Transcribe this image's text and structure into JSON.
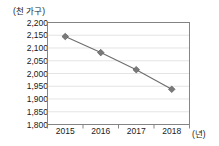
{
  "chart_data": {
    "type": "line",
    "title": "",
    "xlabel": "(년)",
    "ylabel": "(천 가구)",
    "categories": [
      "2015",
      "2016",
      "2017",
      "2018"
    ],
    "values": [
      2145,
      2082,
      2015,
      1938
    ],
    "series": [
      {
        "name": "가구 수",
        "values": [
          2145,
          2082,
          2015,
          1938
        ]
      }
    ],
    "ylim": [
      1800,
      2200
    ],
    "ytick_step": 50,
    "ytick_labels": [
      "2,200",
      "2,150",
      "2,100",
      "2,050",
      "2,000",
      "1,950",
      "1,900",
      "1,850",
      "1,800"
    ],
    "ytick_values": [
      2200,
      2150,
      2100,
      2050,
      2000,
      1950,
      1900,
      1850,
      1800
    ],
    "grid": true,
    "legend": "none",
    "marker": "diamond",
    "line_color": "#6e6e6e",
    "marker_color": "#7a7a7a",
    "grid_color": "#d9d9d9",
    "axis_color": "#7a7a7a",
    "text_color": "#1a1a1a"
  }
}
